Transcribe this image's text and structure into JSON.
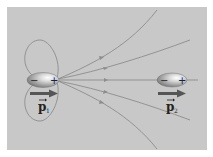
{
  "figure": {
    "background": "#c8c8c8",
    "border_color": "#ffffff",
    "line_color": "#8c8c8c",
    "arrow_color": "#555555"
  },
  "dipoles": [
    {
      "id": "p1",
      "label": "p",
      "subscript": "1",
      "minus": "−",
      "plus": "+",
      "cx": 43,
      "cy": 80
    },
    {
      "id": "p2",
      "label": "p",
      "subscript": "2",
      "minus": "−",
      "plus": "+",
      "cx": 171,
      "cy": 80
    }
  ]
}
